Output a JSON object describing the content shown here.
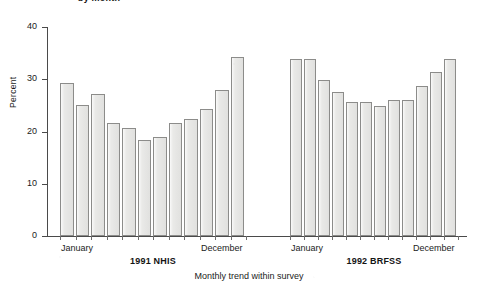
{
  "figure": {
    "title_clipped": "by month",
    "x_axis_title": "Monthly trend within survey",
    "y_axis_title": "Percent"
  },
  "chart_data": {
    "type": "bar",
    "title": "by month",
    "xlabel": "Monthly trend within survey",
    "ylabel": "Percent",
    "ylim": [
      0,
      40
    ],
    "yticks": [
      0,
      10,
      20,
      30,
      40
    ],
    "grid": false,
    "legend": null,
    "categories": [
      "January",
      "February",
      "March",
      "April",
      "May",
      "June",
      "July",
      "August",
      "September",
      "October",
      "November",
      "December"
    ],
    "panels": [
      {
        "name": "1991 NHIS",
        "first_tick_label": "January",
        "last_tick_label": "December",
        "values": [
          29.2,
          25.0,
          27.1,
          21.7,
          20.6,
          18.3,
          19.0,
          21.6,
          22.4,
          24.4,
          28.0,
          34.3
        ]
      },
      {
        "name": "1992 BRFSS",
        "first_tick_label": "January",
        "last_tick_label": "December",
        "values": [
          33.9,
          33.8,
          29.8,
          27.6,
          25.6,
          25.6,
          24.8,
          26.0,
          26.1,
          28.7,
          31.3,
          33.8
        ]
      }
    ],
    "colors": {
      "bar_fill": "#e9e9e7",
      "bar_edge": "#8c8c8a",
      "axis": "#4a4a4a",
      "text": "#1b1b1b",
      "background": "#ffffff"
    }
  }
}
